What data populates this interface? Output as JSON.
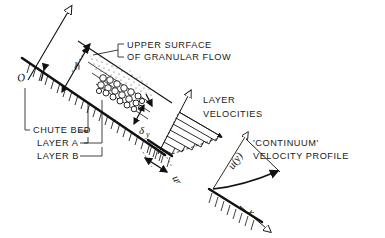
{
  "figure": {
    "caption_labels": {
      "upper_surface_line1": "UPPER SURFACE",
      "upper_surface_line2": "OF GRANULAR FLOW",
      "layer_velocities_line1": "LAYER",
      "layer_velocities_line2": "VELOCITIES",
      "continuum_line1": "'CONTINUUM'",
      "continuum_line2": "VELOCITY PROFILE",
      "chute_bed": "CHUTE BED",
      "layer_a": "LAYER A",
      "layer_b": "LAYER B"
    },
    "symbols": {
      "origin": "O",
      "height": "h",
      "layer_thickness": "δ",
      "layer_thickness_sub": "y",
      "slip_velocity": "u",
      "slip_velocity_sub": "r",
      "velocity_profile": "u(y)",
      "axis_x": "x"
    },
    "colors": {
      "ink": "#111111",
      "background": "#ffffff",
      "hatch": "#222222"
    }
  }
}
